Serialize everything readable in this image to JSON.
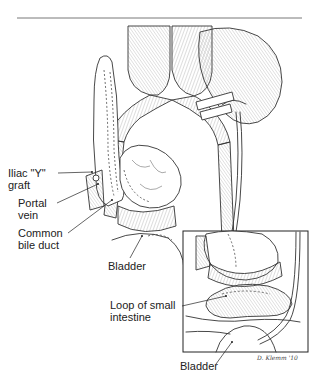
{
  "figure": {
    "type": "surgical-illustration",
    "labels": {
      "iliac_y_graft": "Iliac \"Y\"\ngraft",
      "portal_vein": "Portal\nvein",
      "common_bile_duct": "Common\nbile duct",
      "bladder_main": "Bladder",
      "loop_small_intestine": "Loop of small\nintestine",
      "bladder_inset": "Bladder"
    },
    "signature": "D. Klemm '10",
    "colors": {
      "ink": "#333333",
      "background": "#ffffff"
    }
  }
}
